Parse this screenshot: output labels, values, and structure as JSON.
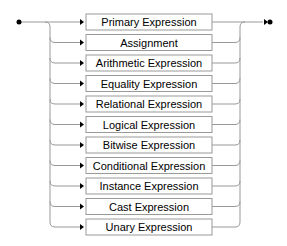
{
  "diagram": {
    "type": "railroad",
    "colors": {
      "line": "#999999",
      "box_stroke": "#999999",
      "box_fill": "#ffffff",
      "text": "#000000",
      "marker": "#000000"
    },
    "items": [
      {
        "label": "Primary Expression"
      },
      {
        "label": "Assignment"
      },
      {
        "label": "Arithmetic Expression"
      },
      {
        "label": "Equality Expression"
      },
      {
        "label": "Relational Expression"
      },
      {
        "label": "Logical Expression"
      },
      {
        "label": "Bitwise Expression"
      },
      {
        "label": "Conditional Expression"
      },
      {
        "label": "Instance Expression"
      },
      {
        "label": "Cast Expression"
      },
      {
        "label": "Unary Expression"
      }
    ]
  }
}
